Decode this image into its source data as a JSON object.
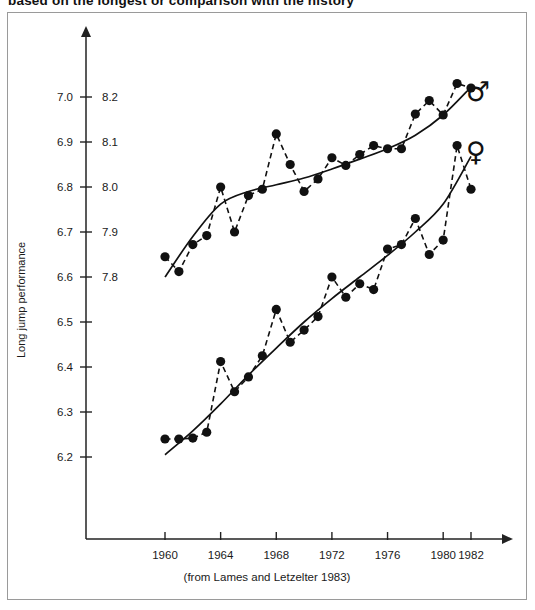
{
  "page": {
    "clipped_heading": "based on the longest or comparison with the history",
    "caption": "(from Lames and Letzelter 1983)"
  },
  "chart_data": {
    "type": "scatter",
    "title": "",
    "xlabel": "",
    "ylabel": "Long jump performance",
    "xlim": [
      1958.2,
      1984.5
    ],
    "ylim_left": [
      6.15,
      7.05
    ],
    "ylim_right": [
      7.75,
      8.25
    ],
    "grid": false,
    "legend_position": "right",
    "x_ticks": [
      1960,
      1964,
      1968,
      1972,
      1976,
      1980,
      1982
    ],
    "y_ticks_left": [
      "6.2",
      "6.3",
      "6.4",
      "6.5",
      "6.6",
      "6.7",
      "6.8",
      "6.9",
      "7.0"
    ],
    "y_ticks_right": [
      "7.8",
      "7.9",
      "8.0",
      "8.1",
      "8.2"
    ],
    "y_tick_values_left": [
      6.2,
      6.3,
      6.4,
      6.5,
      6.6,
      6.7,
      6.8,
      6.9,
      7.0
    ],
    "y_tick_values_right": [
      7.8,
      7.9,
      8.0,
      8.1,
      8.2
    ],
    "right_scale_offset": 1.2,
    "series": [
      {
        "name": "men",
        "symbol": "♂",
        "legend_label": "male",
        "x": [
          1960,
          1961,
          1962,
          1963,
          1964,
          1965,
          1966,
          1967,
          1968,
          1969,
          1970,
          1971,
          1972,
          1973,
          1974,
          1975,
          1976,
          1977,
          1978,
          1979,
          1980,
          1981,
          1982
        ],
        "values": [
          6.645,
          6.612,
          6.672,
          6.692,
          6.8,
          6.7,
          6.781,
          6.795,
          6.918,
          6.85,
          6.79,
          6.818,
          6.865,
          6.848,
          6.872,
          6.892,
          6.885,
          6.885,
          6.962,
          6.992,
          6.96,
          7.03,
          7.02
        ],
        "trend": [
          [
            1960,
            6.6
          ],
          [
            1962,
            6.69
          ],
          [
            1964,
            6.762
          ],
          [
            1966,
            6.79
          ],
          [
            1968,
            6.805
          ],
          [
            1970,
            6.82
          ],
          [
            1972,
            6.84
          ],
          [
            1974,
            6.862
          ],
          [
            1976,
            6.885
          ],
          [
            1978,
            6.915
          ],
          [
            1980,
            6.96
          ],
          [
            1982,
            7.022
          ]
        ]
      },
      {
        "name": "women",
        "symbol": "♀",
        "legend_label": "female",
        "x": [
          1960,
          1961,
          1962,
          1963,
          1964,
          1965,
          1966,
          1967,
          1968,
          1969,
          1970,
          1971,
          1972,
          1973,
          1974,
          1975,
          1976,
          1977,
          1978,
          1979,
          1980,
          1981,
          1982
        ],
        "values": [
          6.24,
          6.24,
          6.242,
          6.255,
          6.412,
          6.345,
          6.378,
          6.425,
          6.528,
          6.455,
          6.482,
          6.512,
          6.6,
          6.555,
          6.585,
          6.572,
          6.662,
          6.672,
          6.73,
          6.65,
          6.682,
          6.892,
          6.795
        ],
        "trend": [
          [
            1960,
            6.205
          ],
          [
            1962,
            6.258
          ],
          [
            1964,
            6.318
          ],
          [
            1966,
            6.382
          ],
          [
            1968,
            6.442
          ],
          [
            1970,
            6.5
          ],
          [
            1972,
            6.552
          ],
          [
            1974,
            6.6
          ],
          [
            1976,
            6.648
          ],
          [
            1978,
            6.7
          ],
          [
            1980,
            6.762
          ],
          [
            1982,
            6.868
          ]
        ]
      }
    ]
  }
}
